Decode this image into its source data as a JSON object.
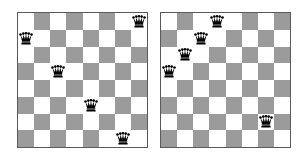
{
  "figure": {
    "colors": {
      "light_square": "#ffffff",
      "dark_square": "#9b9b9b",
      "border": "#5a5a5a",
      "queen": "#000000"
    },
    "boards": [
      {
        "id": "left",
        "size": 8,
        "queens": [
          {
            "row": 0,
            "col": 7
          },
          {
            "row": 1,
            "col": 0
          },
          {
            "row": 3,
            "col": 2
          },
          {
            "row": 5,
            "col": 4
          },
          {
            "row": 7,
            "col": 6
          }
        ]
      },
      {
        "id": "right",
        "size": 8,
        "queens": [
          {
            "row": 0,
            "col": 3
          },
          {
            "row": 1,
            "col": 2
          },
          {
            "row": 2,
            "col": 1
          },
          {
            "row": 3,
            "col": 0
          },
          {
            "row": 6,
            "col": 6
          }
        ]
      }
    ],
    "icons": {
      "queen": "queen-icon"
    }
  }
}
